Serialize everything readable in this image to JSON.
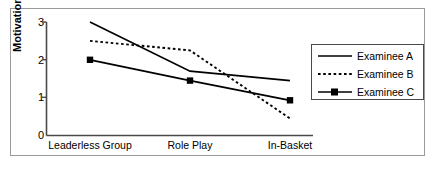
{
  "chart_data": {
    "type": "line",
    "title": "",
    "xlabel": "",
    "ylabel": "Motivation",
    "categories": [
      "Leaderless Group",
      "Role Play",
      "In-Basket"
    ],
    "yticks": [
      "0",
      "1",
      "2",
      "3"
    ],
    "ylim": [
      0,
      3
    ],
    "grid": false,
    "legend_position": "right",
    "series": [
      {
        "name": "Examinee A",
        "values": [
          3.0,
          1.7,
          1.45
        ],
        "style": "solid",
        "marker": "none",
        "color": "#000000"
      },
      {
        "name": "Examinee B",
        "values": [
          2.5,
          2.25,
          0.45
        ],
        "style": "dotted",
        "marker": "none",
        "color": "#000000"
      },
      {
        "name": "Examinee C",
        "values": [
          2.0,
          1.45,
          0.93
        ],
        "style": "solid",
        "marker": "square",
        "color": "#000000"
      }
    ]
  },
  "axis": {
    "y_label": "Motivation",
    "tick_0": "0",
    "tick_1": "1",
    "tick_2": "2",
    "tick_3": "3",
    "x_cat_0": "Leaderless Group",
    "x_cat_1": "Role Play",
    "x_cat_2": "In-Basket"
  },
  "legend": {
    "items": [
      {
        "label": "Examinee A"
      },
      {
        "label": "Examinee B"
      },
      {
        "label": "Examinee C"
      }
    ]
  }
}
